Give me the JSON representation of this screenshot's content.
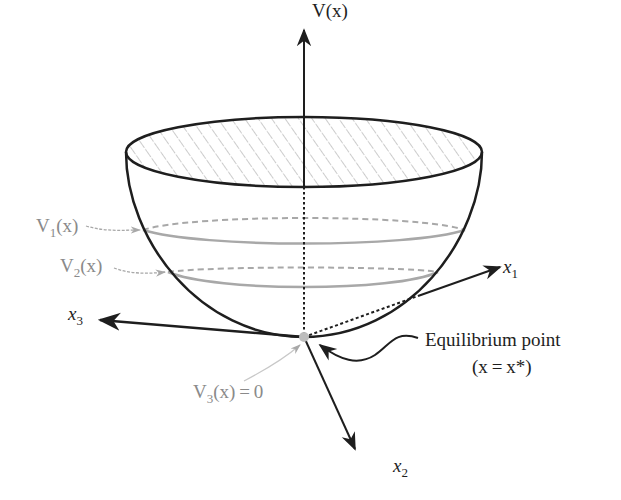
{
  "diagram": {
    "axes": {
      "vertical": {
        "label": "V(x)"
      },
      "x1": {
        "base": "x",
        "sub": "1"
      },
      "x2": {
        "base": "x",
        "sub": "2"
      },
      "x3": {
        "base": "x",
        "sub": "3"
      }
    },
    "level_sets": [
      {
        "id": "V1",
        "base": "V",
        "sub": "1",
        "suffix": "(x)"
      },
      {
        "id": "V2",
        "base": "V",
        "sub": "2",
        "suffix": "(x)"
      },
      {
        "id": "V3",
        "base": "V",
        "sub": "3",
        "suffix": "(x) = 0"
      }
    ],
    "equilibrium": {
      "label_line1": "Equilibrium point",
      "label_line2": "(x = x*)"
    },
    "colors": {
      "outline": "#1e1e1e",
      "level_curve": "#a8a8a8",
      "level_label": "#8a8a8a",
      "hatch": "#9a9a9a",
      "equilibrium_point": "#bdbdbd"
    }
  }
}
